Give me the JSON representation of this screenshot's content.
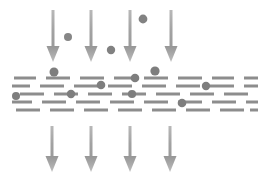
{
  "figure": {
    "type": "diagram",
    "canvas": {
      "width": 267,
      "height": 180,
      "background": "#ffffff"
    },
    "colors": {
      "arrow": "#9a9a9a",
      "arrow_light": "#b4b4b4",
      "particle": "#7d7d7d",
      "dash": "#8a8a8a",
      "background": "#ffffff"
    },
    "flow_direction": "downward",
    "inlet_arrows": {
      "label": "inlet-flow-arrows",
      "count": 4,
      "y_top": 10,
      "y_tip": 62,
      "shaft_width": 3,
      "head_width": 13,
      "head_height": 16,
      "x_positions": [
        53,
        91,
        130,
        171
      ]
    },
    "outlet_arrows": {
      "label": "outlet-flow-arrows",
      "count": 4,
      "y_top": 126,
      "y_tip": 172,
      "shaft_width": 3,
      "head_width": 13,
      "head_height": 16,
      "x_positions": [
        52,
        91,
        130,
        170
      ]
    },
    "free_particles": {
      "label": "suspended-particles-above-medium",
      "count": 3,
      "items": [
        {
          "cx": 68,
          "cy": 37,
          "r": 4.0
        },
        {
          "cx": 111,
          "cy": 50,
          "r": 4.2
        },
        {
          "cx": 143,
          "cy": 19,
          "r": 4.4
        }
      ]
    },
    "captured_particles": {
      "label": "particles-captured-in-medium",
      "count": 7,
      "items": [
        {
          "cx": 54,
          "cy": 72,
          "r": 4.5
        },
        {
          "cx": 135,
          "cy": 78,
          "r": 4.3
        },
        {
          "cx": 155,
          "cy": 71,
          "r": 4.6
        },
        {
          "cx": 71,
          "cy": 94,
          "r": 4.2
        },
        {
          "cx": 101,
          "cy": 85,
          "r": 4.3
        },
        {
          "cx": 132,
          "cy": 94,
          "r": 4.1
        },
        {
          "cx": 182,
          "cy": 103,
          "r": 4.3
        },
        {
          "cx": 206,
          "cy": 86,
          "r": 4.2
        },
        {
          "cx": 16,
          "cy": 96,
          "r": 4.0
        }
      ]
    },
    "medium": {
      "label": "porous-filter-medium",
      "x_start": 12,
      "x_end": 256,
      "dash_rows": 5,
      "row_y": [
        78,
        86,
        94,
        102,
        110
      ],
      "dash_thickness": 3,
      "dash_length": 24,
      "dash_gap": 10,
      "row_offsets": [
        0,
        12,
        4,
        16,
        7
      ]
    }
  }
}
